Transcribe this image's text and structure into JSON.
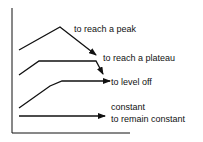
{
  "diagram": {
    "colors": {
      "line": "#111111",
      "background": "#ffffff"
    },
    "trends": [
      {
        "id": "peak",
        "label": "to reach a peak",
        "shape": "rise then fall"
      },
      {
        "id": "plateau",
        "label": "to reach a plateau",
        "shape": "rise, flat, then drop"
      },
      {
        "id": "level-off",
        "label": "to level off",
        "shape": "rise then flatten"
      },
      {
        "id": "constant",
        "label_top": "constant",
        "label": "to remain constant",
        "shape": "flat"
      }
    ]
  }
}
